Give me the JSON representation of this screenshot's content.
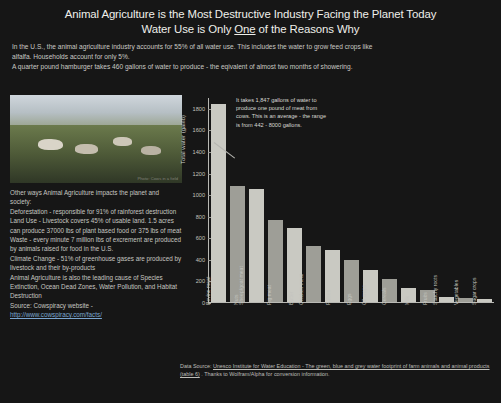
{
  "header": {
    "title_line1_a": "Animal Agriculture is the Most Destructive Industry Facing the Planet Today",
    "title_line2_a": "Water Use is Only ",
    "title_line2_underlined": "One",
    "title_line2_b": " of the Reasons Why"
  },
  "intro": {
    "line1": "In the U.S., the animal agriculture industry accounts for 55% of all water use. This includes the water to grow feed crops like",
    "line2": "alfalfa. Households account for only 5%.",
    "line3": "A quarter pound hamburger takes 460 gallons of water to produce - the eqivalent of almost two months of showering."
  },
  "photo": {
    "credit": "Photo: Cows in a field"
  },
  "facts": {
    "heading": "Other ways Animal Agriculture impacts the planet and society:",
    "deforestation": "Deforestation - responsible for 91% of rainforest destruction",
    "land_use": "Land Use - Livestock covers 45% of usable land. 1.5 acres can produce  37000 lbs of plant based food or 375 lbs of meat",
    "waste": "Waste - every minute 7 million lbs of excrement are produced by animals raised for food in the U.S.",
    "climate": "Climate Change - 51% of greenhouse gases are produced by livestock and their by-products",
    "other": "Animal Agriculture is also the leading cause of Species Extinction, Ocean Dead Zones, Water Pollution, and Habitat Destruction",
    "source_label": "Source: Cowspiracy website - ",
    "source_url": "http://www.cowspiracy.com/facts/"
  },
  "chart_data": {
    "type": "bar",
    "title": "",
    "xlabel": "",
    "ylabel": "Total water (gal/lb)",
    "ylim": [
      0,
      1900
    ],
    "yticks": [
      0,
      200,
      400,
      600,
      800,
      1000,
      1200,
      1400,
      1600,
      1800
    ],
    "grid": false,
    "legend": "none",
    "categories": [
      "Bovine meat",
      "Nuts",
      "Sheep/goat meat",
      "Pig meat",
      "Butter",
      "Chicken meat",
      "Pulses",
      "Eggs",
      "Oil crops",
      "Cereals",
      "Milk",
      "Fruits",
      "Starchy roots",
      "Vegetables",
      "Sugar crops"
    ],
    "values": [
      1847,
      1080,
      1050,
      765,
      690,
      520,
      480,
      395,
      300,
      215,
      135,
      110,
      45,
      38,
      25
    ],
    "annotation": "It takes 1,847 gallons of water to produce one pound of meat from cows. This is an average - the range is from 442 - 8000 gallons.",
    "source_prefix": "Data Source: ",
    "source_link": "Unesco Institute for Water Education - The green, blue and grey water footprint of farm animals and animal products (table 6)",
    "source_suffix": " . Thanks to Wolfram/Alpha for conversion information."
  }
}
